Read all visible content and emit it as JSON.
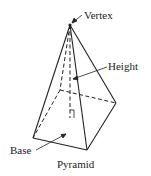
{
  "diagram": {
    "title": "Pyramid",
    "labels": {
      "vertex": "Vertex",
      "height": "Height",
      "base": "Base"
    },
    "colors": {
      "stroke": "#222222",
      "background": "#ffffff"
    }
  }
}
